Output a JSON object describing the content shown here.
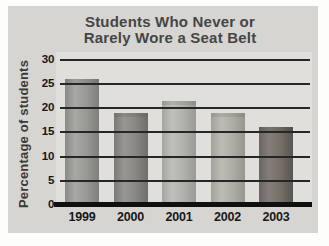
{
  "chart": {
    "title_line1": "Students Who Never or",
    "title_line2": "Rarely Wore a Seat Belt",
    "ylabel": "Percentage of students"
  },
  "chart_data": {
    "type": "bar",
    "title": "Students Who Never or Rarely Wore a Seat Belt",
    "xlabel": "",
    "ylabel": "Percentage of students",
    "categories": [
      "1999",
      "2000",
      "2001",
      "2002",
      "2003"
    ],
    "values": [
      26,
      19,
      21.5,
      19,
      16
    ],
    "ylim": [
      0,
      30
    ],
    "yticks": [
      0,
      5,
      10,
      15,
      20,
      25,
      30
    ],
    "grid": true,
    "legend": false,
    "gridline_color": "#262626",
    "bar_colors": [
      {
        "edge_left": "#8a8a86",
        "light": "#a8a8a4",
        "mid": "#999995",
        "edge_right": "#7e7e7c"
      },
      {
        "edge_left": "#7c7a76",
        "light": "#989692",
        "mid": "#8a8884",
        "edge_right": "#706e6a"
      },
      {
        "edge_left": "#a6a6a0",
        "light": "#c0c0ba",
        "mid": "#b2b2ac",
        "edge_right": "#9a9a94"
      },
      {
        "edge_left": "#a2a29a",
        "light": "#bcbcb4",
        "mid": "#aeaea6",
        "edge_right": "#96968e"
      },
      {
        "edge_left": "#6a6662",
        "light": "#847e7a",
        "mid": "#767068",
        "edge_right": "#585450"
      }
    ],
    "colors": {
      "card_background": "#d7d5d1",
      "plot_background": "#e1dfdb",
      "title_text": "#454545",
      "axis_text": "#161616",
      "baseline": "#101010"
    }
  }
}
